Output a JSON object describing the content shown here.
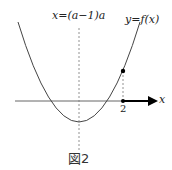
{
  "figure": {
    "axis_line_label": "x=(a−1)a",
    "curve_label": "y=f(x)",
    "x_axis_label": "x",
    "tick_label": "2",
    "caption": "図2"
  },
  "colors": {
    "curve": "#444444",
    "axis": "#555555",
    "arrow": "#000000",
    "dashed": "#777777"
  }
}
